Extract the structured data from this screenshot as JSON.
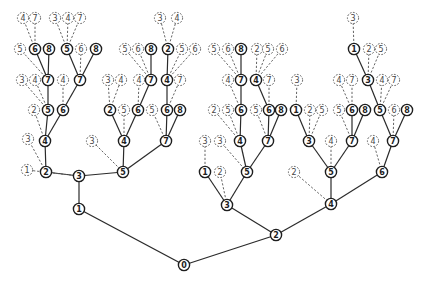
{
  "diagram": {
    "type": "search-tree",
    "node_radius": 5.6,
    "colors": {
      "solid": "#1e1e1e",
      "dashed": "#555555",
      "background": "#ffffff"
    },
    "nodes": [
      {
        "id": "r",
        "label": "0",
        "x": 184,
        "y": 265,
        "style": "solid"
      },
      {
        "id": "a1",
        "label": "1",
        "x": 79,
        "y": 209,
        "style": "solid"
      },
      {
        "id": "a2",
        "label": "2",
        "x": 276,
        "y": 235,
        "style": "solid"
      },
      {
        "id": "b3",
        "label": "3",
        "x": 79,
        "y": 176,
        "style": "solid"
      },
      {
        "id": "c2",
        "label": "2",
        "x": 46,
        "y": 172,
        "style": "solid"
      },
      {
        "id": "c1d",
        "label": "1",
        "x": 27,
        "y": 170,
        "style": "dash"
      },
      {
        "id": "c5",
        "label": "5",
        "x": 123,
        "y": 172,
        "style": "solid"
      },
      {
        "id": "d4",
        "label": "4",
        "x": 45,
        "y": 141,
        "style": "solid"
      },
      {
        "id": "d3d",
        "label": "3",
        "x": 28,
        "y": 139,
        "style": "dash"
      },
      {
        "id": "e5",
        "label": "5",
        "x": 48,
        "y": 110,
        "style": "solid"
      },
      {
        "id": "e6",
        "label": "6",
        "x": 63,
        "y": 110,
        "style": "solid"
      },
      {
        "id": "e2d",
        "label": "2",
        "x": 34,
        "y": 110,
        "style": "dash"
      },
      {
        "id": "f7a",
        "label": "7",
        "x": 48,
        "y": 80,
        "style": "solid"
      },
      {
        "id": "f3d",
        "label": "3",
        "x": 22,
        "y": 80,
        "style": "dash"
      },
      {
        "id": "f4d",
        "label": "4",
        "x": 35,
        "y": 80,
        "style": "dash"
      },
      {
        "id": "f7b",
        "label": "7",
        "x": 80,
        "y": 80,
        "style": "solid"
      },
      {
        "id": "f4e",
        "label": "4",
        "x": 63,
        "y": 80,
        "style": "dash"
      },
      {
        "id": "g6",
        "label": "6",
        "x": 35,
        "y": 49,
        "style": "solid"
      },
      {
        "id": "g8",
        "label": "8",
        "x": 49,
        "y": 49,
        "style": "solid"
      },
      {
        "id": "g5d",
        "label": "5",
        "x": 20,
        "y": 49,
        "style": "dash"
      },
      {
        "id": "g5",
        "label": "5",
        "x": 67,
        "y": 49,
        "style": "solid"
      },
      {
        "id": "g6d",
        "label": "6",
        "x": 81,
        "y": 49,
        "style": "dash"
      },
      {
        "id": "g8b",
        "label": "8",
        "x": 96,
        "y": 49,
        "style": "solid"
      },
      {
        "id": "h4d",
        "label": "4",
        "x": 23,
        "y": 18,
        "style": "dash"
      },
      {
        "id": "h7d",
        "label": "7",
        "x": 35,
        "y": 18,
        "style": "dash"
      },
      {
        "id": "h3d",
        "label": "3",
        "x": 55,
        "y": 18,
        "style": "dash"
      },
      {
        "id": "h4e",
        "label": "4",
        "x": 68,
        "y": 18,
        "style": "dash"
      },
      {
        "id": "h7e",
        "label": "7",
        "x": 80,
        "y": 18,
        "style": "dash"
      },
      {
        "id": "i4",
        "label": "4",
        "x": 124,
        "y": 141,
        "style": "solid"
      },
      {
        "id": "i3d",
        "label": "3",
        "x": 92,
        "y": 141,
        "style": "dash"
      },
      {
        "id": "i7",
        "label": "7",
        "x": 166,
        "y": 141,
        "style": "solid"
      },
      {
        "id": "j2",
        "label": "2",
        "x": 110,
        "y": 110,
        "style": "solid"
      },
      {
        "id": "j5d",
        "label": "5",
        "x": 124,
        "y": 110,
        "style": "dash"
      },
      {
        "id": "j6",
        "label": "6",
        "x": 138,
        "y": 110,
        "style": "solid"
      },
      {
        "id": "j5e",
        "label": "5",
        "x": 152,
        "y": 110,
        "style": "dash"
      },
      {
        "id": "j6b",
        "label": "6",
        "x": 167,
        "y": 110,
        "style": "solid"
      },
      {
        "id": "j8",
        "label": "8",
        "x": 180,
        "y": 110,
        "style": "solid"
      },
      {
        "id": "k3d",
        "label": "3",
        "x": 108,
        "y": 80,
        "style": "dash"
      },
      {
        "id": "k4d",
        "label": "4",
        "x": 121,
        "y": 80,
        "style": "dash"
      },
      {
        "id": "k4e",
        "label": "4",
        "x": 139,
        "y": 80,
        "style": "dash"
      },
      {
        "id": "k7",
        "label": "7",
        "x": 151,
        "y": 80,
        "style": "solid"
      },
      {
        "id": "k4",
        "label": "4",
        "x": 167,
        "y": 80,
        "style": "solid"
      },
      {
        "id": "k7d",
        "label": "7",
        "x": 180,
        "y": 80,
        "style": "dash"
      },
      {
        "id": "l5d",
        "label": "5",
        "x": 125,
        "y": 49,
        "style": "dash"
      },
      {
        "id": "l6d",
        "label": "6",
        "x": 138,
        "y": 49,
        "style": "dash"
      },
      {
        "id": "l8",
        "label": "8",
        "x": 151,
        "y": 49,
        "style": "solid"
      },
      {
        "id": "l2",
        "label": "2",
        "x": 168,
        "y": 49,
        "style": "solid"
      },
      {
        "id": "l5e",
        "label": "5",
        "x": 182,
        "y": 49,
        "style": "dash"
      },
      {
        "id": "l6e",
        "label": "6",
        "x": 195,
        "y": 49,
        "style": "dash"
      },
      {
        "id": "m3d",
        "label": "3",
        "x": 160,
        "y": 18,
        "style": "dash"
      },
      {
        "id": "m4d",
        "label": "4",
        "x": 177,
        "y": 18,
        "style": "dash"
      },
      {
        "id": "n3",
        "label": "3",
        "x": 227,
        "y": 205,
        "style": "solid"
      },
      {
        "id": "n4",
        "label": "4",
        "x": 331,
        "y": 204,
        "style": "solid"
      },
      {
        "id": "o1",
        "label": "1",
        "x": 205,
        "y": 172,
        "style": "solid"
      },
      {
        "id": "o2d",
        "label": "2",
        "x": 220,
        "y": 172,
        "style": "dash"
      },
      {
        "id": "o5",
        "label": "5",
        "x": 247,
        "y": 172,
        "style": "solid"
      },
      {
        "id": "o3d",
        "label": "3",
        "x": 205,
        "y": 141,
        "style": "dash"
      },
      {
        "id": "o3e",
        "label": "3",
        "x": 220,
        "y": 141,
        "style": "dash"
      },
      {
        "id": "p4",
        "label": "4",
        "x": 240,
        "y": 141,
        "style": "solid"
      },
      {
        "id": "p7",
        "label": "7",
        "x": 268,
        "y": 141,
        "style": "solid"
      },
      {
        "id": "q2d",
        "label": "2",
        "x": 214,
        "y": 110,
        "style": "dash"
      },
      {
        "id": "q5d",
        "label": "5",
        "x": 228,
        "y": 110,
        "style": "dash"
      },
      {
        "id": "q6",
        "label": "6",
        "x": 241,
        "y": 110,
        "style": "solid"
      },
      {
        "id": "q5e",
        "label": "5",
        "x": 256,
        "y": 110,
        "style": "dash"
      },
      {
        "id": "q6b",
        "label": "6",
        "x": 269,
        "y": 110,
        "style": "solid"
      },
      {
        "id": "q8",
        "label": "8",
        "x": 281,
        "y": 110,
        "style": "solid"
      },
      {
        "id": "s4d",
        "label": "4",
        "x": 228,
        "y": 80,
        "style": "dash"
      },
      {
        "id": "s7",
        "label": "7",
        "x": 241,
        "y": 80,
        "style": "solid"
      },
      {
        "id": "s4",
        "label": "4",
        "x": 256,
        "y": 80,
        "style": "solid"
      },
      {
        "id": "s7d",
        "label": "7",
        "x": 269,
        "y": 80,
        "style": "dash"
      },
      {
        "id": "t5d",
        "label": "5",
        "x": 214,
        "y": 49,
        "style": "dash"
      },
      {
        "id": "t6d",
        "label": "6",
        "x": 228,
        "y": 49,
        "style": "dash"
      },
      {
        "id": "t8",
        "label": "8",
        "x": 241,
        "y": 49,
        "style": "solid"
      },
      {
        "id": "t2d",
        "label": "2",
        "x": 257,
        "y": 49,
        "style": "dash"
      },
      {
        "id": "t5e",
        "label": "5",
        "x": 268,
        "y": 49,
        "style": "dash"
      },
      {
        "id": "t6e",
        "label": "6",
        "x": 282,
        "y": 49,
        "style": "dash"
      },
      {
        "id": "u5",
        "label": "5",
        "x": 331,
        "y": 172,
        "style": "solid"
      },
      {
        "id": "u2d",
        "label": "2",
        "x": 294,
        "y": 172,
        "style": "dash"
      },
      {
        "id": "u6",
        "label": "6",
        "x": 382,
        "y": 172,
        "style": "solid"
      },
      {
        "id": "v3",
        "label": "3",
        "x": 309,
        "y": 141,
        "style": "solid"
      },
      {
        "id": "v4d",
        "label": "4",
        "x": 331,
        "y": 141,
        "style": "dash"
      },
      {
        "id": "v7",
        "label": "7",
        "x": 352,
        "y": 141,
        "style": "solid"
      },
      {
        "id": "v4e",
        "label": "4",
        "x": 373,
        "y": 141,
        "style": "dash"
      },
      {
        "id": "v7b",
        "label": "7",
        "x": 393,
        "y": 141,
        "style": "solid"
      },
      {
        "id": "w1",
        "label": "1",
        "x": 296,
        "y": 110,
        "style": "solid"
      },
      {
        "id": "w2d",
        "label": "2",
        "x": 310,
        "y": 110,
        "style": "dash"
      },
      {
        "id": "w5d",
        "label": "5",
        "x": 322,
        "y": 110,
        "style": "dash"
      },
      {
        "id": "w5e",
        "label": "5",
        "x": 339,
        "y": 110,
        "style": "dash"
      },
      {
        "id": "w6",
        "label": "6",
        "x": 352,
        "y": 110,
        "style": "solid"
      },
      {
        "id": "w8",
        "label": "8",
        "x": 365,
        "y": 110,
        "style": "solid"
      },
      {
        "id": "w5",
        "label": "5",
        "x": 380,
        "y": 110,
        "style": "solid"
      },
      {
        "id": "w6d",
        "label": "6",
        "x": 394,
        "y": 110,
        "style": "dash"
      },
      {
        "id": "w8b",
        "label": "8",
        "x": 407,
        "y": 110,
        "style": "solid"
      },
      {
        "id": "x3d",
        "label": "3",
        "x": 297,
        "y": 80,
        "style": "dash"
      },
      {
        "id": "x4d",
        "label": "4",
        "x": 339,
        "y": 80,
        "style": "dash"
      },
      {
        "id": "x7d",
        "label": "7",
        "x": 352,
        "y": 80,
        "style": "dash"
      },
      {
        "id": "x3",
        "label": "3",
        "x": 368,
        "y": 80,
        "style": "solid"
      },
      {
        "id": "x4e",
        "label": "4",
        "x": 382,
        "y": 80,
        "style": "dash"
      },
      {
        "id": "x7e",
        "label": "7",
        "x": 394,
        "y": 80,
        "style": "dash"
      },
      {
        "id": "y1",
        "label": "1",
        "x": 354,
        "y": 49,
        "style": "solid"
      },
      {
        "id": "y2d",
        "label": "2",
        "x": 369,
        "y": 49,
        "style": "dash"
      },
      {
        "id": "y5d",
        "label": "5",
        "x": 381,
        "y": 49,
        "style": "dash"
      },
      {
        "id": "z3d",
        "label": "3",
        "x": 353,
        "y": 18,
        "style": "dash"
      }
    ],
    "edges": [
      [
        "r",
        "a1",
        "solid"
      ],
      [
        "r",
        "a2",
        "solid"
      ],
      [
        "a1",
        "b3",
        "solid"
      ],
      [
        "b3",
        "c2",
        "solid"
      ],
      [
        "b3",
        "c1d",
        "dash"
      ],
      [
        "b3",
        "c5",
        "solid"
      ],
      [
        "c2",
        "d4",
        "solid"
      ],
      [
        "c2",
        "d3d",
        "dash"
      ],
      [
        "d4",
        "e5",
        "solid"
      ],
      [
        "d4",
        "e6",
        "solid"
      ],
      [
        "d4",
        "e2d",
        "dash"
      ],
      [
        "e5",
        "f7a",
        "solid"
      ],
      [
        "e5",
        "f3d",
        "dash"
      ],
      [
        "e5",
        "f4d",
        "dash"
      ],
      [
        "e6",
        "f7b",
        "solid"
      ],
      [
        "e6",
        "f4e",
        "dash"
      ],
      [
        "f7a",
        "g6",
        "solid"
      ],
      [
        "f7a",
        "g8",
        "solid"
      ],
      [
        "f7a",
        "g5d",
        "dash"
      ],
      [
        "f7b",
        "g5",
        "solid"
      ],
      [
        "f7b",
        "g6d",
        "dash"
      ],
      [
        "f7b",
        "g8b",
        "solid"
      ],
      [
        "g6",
        "h4d",
        "dash"
      ],
      [
        "g6",
        "h7d",
        "dash"
      ],
      [
        "g5",
        "h3d",
        "dash"
      ],
      [
        "g5",
        "h4e",
        "dash"
      ],
      [
        "g5",
        "h7e",
        "dash"
      ],
      [
        "c5",
        "i4",
        "solid"
      ],
      [
        "c5",
        "i3d",
        "dash"
      ],
      [
        "c5",
        "i7",
        "solid"
      ],
      [
        "i4",
        "j2",
        "solid"
      ],
      [
        "i4",
        "j5d",
        "dash"
      ],
      [
        "i4",
        "j6",
        "solid"
      ],
      [
        "i7",
        "j5e",
        "dash"
      ],
      [
        "i7",
        "j6b",
        "solid"
      ],
      [
        "i7",
        "j8",
        "solid"
      ],
      [
        "j2",
        "k3d",
        "dash"
      ],
      [
        "j2",
        "k4d",
        "dash"
      ],
      [
        "j6",
        "k4e",
        "dash"
      ],
      [
        "j6",
        "k7",
        "solid"
      ],
      [
        "j6b",
        "k4",
        "solid"
      ],
      [
        "j6b",
        "k7d",
        "dash"
      ],
      [
        "k7",
        "l5d",
        "dash"
      ],
      [
        "k7",
        "l6d",
        "dash"
      ],
      [
        "k7",
        "l8",
        "solid"
      ],
      [
        "k4",
        "l2",
        "solid"
      ],
      [
        "k4",
        "l5e",
        "dash"
      ],
      [
        "k4",
        "l6e",
        "dash"
      ],
      [
        "l2",
        "m3d",
        "dash"
      ],
      [
        "l2",
        "m4d",
        "dash"
      ],
      [
        "a2",
        "n3",
        "solid"
      ],
      [
        "a2",
        "n4",
        "solid"
      ],
      [
        "n3",
        "o1",
        "solid"
      ],
      [
        "n3",
        "o2d",
        "dash"
      ],
      [
        "n3",
        "o5",
        "solid"
      ],
      [
        "o1",
        "o3d",
        "dash"
      ],
      [
        "o5",
        "o3e",
        "dash"
      ],
      [
        "o5",
        "p4",
        "solid"
      ],
      [
        "o5",
        "p7",
        "solid"
      ],
      [
        "p4",
        "q2d",
        "dash"
      ],
      [
        "p4",
        "q5d",
        "dash"
      ],
      [
        "p4",
        "q6",
        "solid"
      ],
      [
        "p7",
        "q5e",
        "dash"
      ],
      [
        "p7",
        "q6b",
        "solid"
      ],
      [
        "p7",
        "q8",
        "solid"
      ],
      [
        "q6",
        "s4d",
        "dash"
      ],
      [
        "q6",
        "s7",
        "solid"
      ],
      [
        "q6b",
        "s4",
        "solid"
      ],
      [
        "q6b",
        "s7d",
        "dash"
      ],
      [
        "s7",
        "t5d",
        "dash"
      ],
      [
        "s7",
        "t6d",
        "dash"
      ],
      [
        "s7",
        "t8",
        "solid"
      ],
      [
        "s4",
        "t2d",
        "dash"
      ],
      [
        "s4",
        "t5e",
        "dash"
      ],
      [
        "s4",
        "t6e",
        "dash"
      ],
      [
        "n4",
        "u2d",
        "dash"
      ],
      [
        "n4",
        "u5",
        "solid"
      ],
      [
        "n4",
        "u6",
        "solid"
      ],
      [
        "u5",
        "v3",
        "solid"
      ],
      [
        "u5",
        "v4d",
        "dash"
      ],
      [
        "u5",
        "v7",
        "solid"
      ],
      [
        "u6",
        "v4e",
        "dash"
      ],
      [
        "u6",
        "v7b",
        "solid"
      ],
      [
        "v3",
        "w1",
        "solid"
      ],
      [
        "v3",
        "w2d",
        "dash"
      ],
      [
        "v3",
        "w5d",
        "dash"
      ],
      [
        "v7",
        "w5e",
        "dash"
      ],
      [
        "v7",
        "w6",
        "solid"
      ],
      [
        "v7",
        "w8",
        "solid"
      ],
      [
        "v7b",
        "w5",
        "solid"
      ],
      [
        "v7b",
        "w6d",
        "dash"
      ],
      [
        "v7b",
        "w8b",
        "solid"
      ],
      [
        "w1",
        "x3d",
        "dash"
      ],
      [
        "w6",
        "x4d",
        "dash"
      ],
      [
        "w6",
        "x7d",
        "dash"
      ],
      [
        "w5",
        "x3",
        "solid"
      ],
      [
        "w5",
        "x4e",
        "dash"
      ],
      [
        "w5",
        "x7e",
        "dash"
      ],
      [
        "x3",
        "y1",
        "solid"
      ],
      [
        "x3",
        "y2d",
        "dash"
      ],
      [
        "x3",
        "y5d",
        "dash"
      ],
      [
        "y1",
        "z3d",
        "dash"
      ]
    ]
  }
}
